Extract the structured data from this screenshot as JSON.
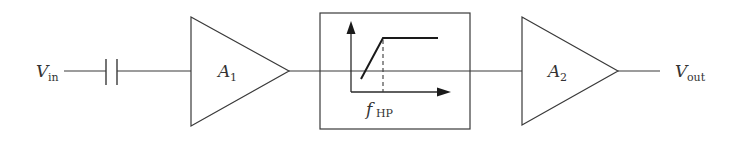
{
  "diagram": {
    "type": "block-diagram",
    "input": {
      "symbol": "V",
      "subscript": "in"
    },
    "output": {
      "symbol": "V",
      "subscript": "out"
    },
    "components": [
      {
        "id": "coupling-capacitor",
        "kind": "capacitor"
      },
      {
        "id": "amp1",
        "kind": "amplifier",
        "label": {
          "symbol": "A",
          "subscript": "1"
        }
      },
      {
        "id": "hp-filter",
        "kind": "filter-block",
        "response": "high-pass",
        "cutoff_label": {
          "symbol": "f",
          "subscript": "HP"
        }
      },
      {
        "id": "amp2",
        "kind": "amplifier",
        "label": {
          "symbol": "A",
          "subscript": "2"
        }
      }
    ],
    "connections": [
      [
        "input",
        "coupling-capacitor"
      ],
      [
        "coupling-capacitor",
        "amp1"
      ],
      [
        "amp1",
        "hp-filter"
      ],
      [
        "hp-filter",
        "amp2"
      ],
      [
        "amp2",
        "output"
      ]
    ],
    "colors": {
      "line": "#3a3a3a",
      "text": "#333333",
      "background": "#ffffff"
    }
  }
}
